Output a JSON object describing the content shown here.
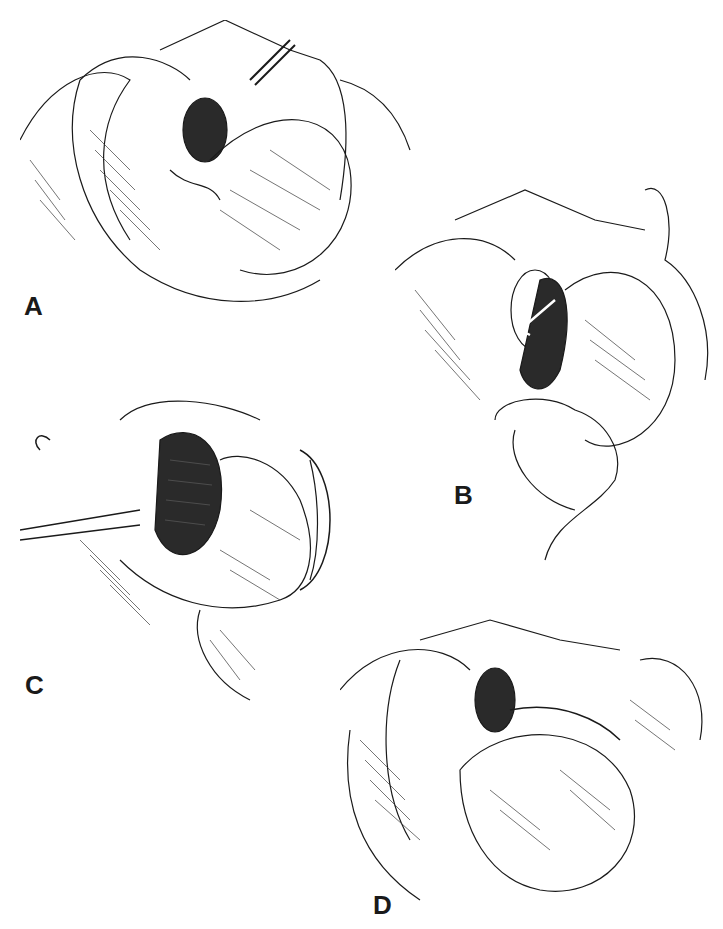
{
  "figure": {
    "type": "surgical illustration sequence",
    "panels": [
      {
        "id": "A",
        "label": "A",
        "subject": "exposed hiatus with suture placement beside esophagus"
      },
      {
        "id": "B",
        "label": "B",
        "subject": "hand retracting fundus behind esophagus (arrow)"
      },
      {
        "id": "C",
        "label": "C",
        "subject": "wrap being sutured with needle holder"
      },
      {
        "id": "D",
        "label": "D",
        "subject": "completed fundoplication wrap"
      }
    ]
  },
  "colors": {
    "ink": "#1a1a1a",
    "shade": "#3a3a3a",
    "background": "#ffffff"
  }
}
